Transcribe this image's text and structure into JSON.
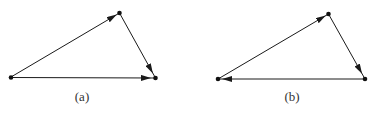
{
  "figures": [
    {
      "label": "(a)",
      "points": [
        [
          11,
          77
        ],
        [
          119.5,
          13
        ],
        [
          155.5,
          78
        ]
      ],
      "vectors": "A→B, B→C, A→C"
    },
    {
      "label": "(b)",
      "points": [
        [
          218,
          79
        ],
        [
          328.5,
          14
        ],
        [
          365,
          79
        ]
      ],
      "vectors": "A→B, B→C, C→A"
    }
  ],
  "colors": {
    "line": "#1a1a1a",
    "background": "#ffffff"
  }
}
